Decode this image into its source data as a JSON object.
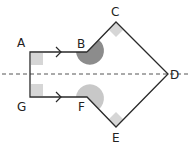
{
  "diagram": {
    "colors": {
      "outline": "#2a2a2a",
      "symmetry_line": "#555555",
      "right_angle_fill": "#d6d6d6",
      "angle_b_fill": "#8c8c8c",
      "angle_f_fill": "#c8c8c8",
      "label": "#222222"
    },
    "vertices": [
      {
        "label": "A",
        "x": 30,
        "y": 52
      },
      {
        "label": "B",
        "x": 87,
        "y": 52
      },
      {
        "label": "C",
        "x": 116,
        "y": 22
      },
      {
        "label": "D",
        "x": 168,
        "y": 74
      },
      {
        "label": "E",
        "x": 116,
        "y": 127
      },
      {
        "label": "F",
        "x": 87,
        "y": 97
      },
      {
        "label": "G",
        "x": 30,
        "y": 97
      }
    ],
    "labels": {
      "A": "A",
      "B": "B",
      "C": "C",
      "D": "D",
      "E": "E",
      "F": "F",
      "G": "G"
    },
    "symmetry_line": {
      "y": 74,
      "x_start": 0,
      "x_end": 191,
      "style": "dashed"
    },
    "parallel_marks": [
      "AB",
      "GF"
    ],
    "right_angles": [
      "A",
      "G",
      "C",
      "E"
    ],
    "angle_arcs": [
      {
        "vertex": "B",
        "shade": "dark"
      },
      {
        "vertex": "F",
        "shade": "light"
      }
    ]
  }
}
